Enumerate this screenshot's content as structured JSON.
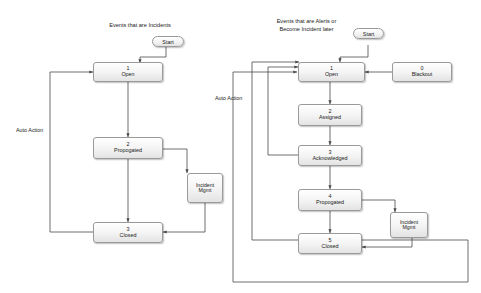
{
  "diagram": {
    "title_left": "Events that are Incidents",
    "title_right": "Events that are Alerts or\nBecome Incident later",
    "colors": {
      "node_border": "#9a9a9a",
      "node_fill": "#f1f1f1",
      "line": "#4a4a4a",
      "text": "#1a1a1a"
    },
    "left": {
      "start_label": "Start",
      "auto_action_label": "Auto Action",
      "nodes": [
        {
          "num": "1",
          "name": "Open"
        },
        {
          "num": "2",
          "name": "Propogated"
        },
        {
          "num": "3",
          "name": "Closed"
        }
      ],
      "incident_mgmt": {
        "line1": "Incident",
        "line2": "Mgmt"
      }
    },
    "right": {
      "start_label": "Start",
      "auto_action_label": "Auto Action",
      "blackout": {
        "num": "0",
        "name": "Blackout"
      },
      "nodes": [
        {
          "num": "1",
          "name": "Open"
        },
        {
          "num": "2",
          "name": "Assigned"
        },
        {
          "num": "3",
          "name": "Acknowledged"
        },
        {
          "num": "4",
          "name": "Propogated"
        },
        {
          "num": "5",
          "name": "Closed"
        }
      ],
      "incident_mgmt": {
        "line1": "Incident",
        "line2": "Mgmt"
      }
    }
  }
}
